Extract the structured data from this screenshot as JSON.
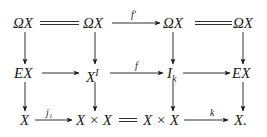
{
  "diagram": {
    "type": "commutative-diagram",
    "rows": [
      [
        "ΩX",
        "ΩX",
        "ΩX",
        "ΩX"
      ],
      [
        "EX",
        "X^I",
        "I_k",
        "EX"
      ],
      [
        "X",
        "X × X",
        "X × X",
        "X."
      ]
    ],
    "nodes": {
      "r0c0": "ΩX",
      "r0c1": "ΩX",
      "r0c2": "ΩX",
      "r0c3": "ΩX",
      "r1c0": "EX",
      "r1c1_base": "X",
      "r1c1_sup": "I",
      "r1c2_base": "I",
      "r1c2_sub": "k",
      "r1c3": "EX",
      "r2c0": "X",
      "r2c1": "X × X",
      "r2c2": "X × X",
      "r2c3": "X."
    },
    "edge_labels": {
      "top_middle": "f′",
      "mid_middle": "f",
      "bottom_left": "j₁",
      "bottom_right": "k"
    },
    "edges": [
      {
        "from": "r0c0",
        "to": "r0c1",
        "style": "equals"
      },
      {
        "from": "r0c1",
        "to": "r0c2",
        "style": "arrow",
        "label": "f′"
      },
      {
        "from": "r0c2",
        "to": "r0c3",
        "style": "equals"
      },
      {
        "from": "r1c0",
        "to": "r1c1",
        "style": "arrow"
      },
      {
        "from": "r1c1",
        "to": "r1c2",
        "style": "arrow",
        "label": "f"
      },
      {
        "from": "r1c2",
        "to": "r1c3",
        "style": "arrow"
      },
      {
        "from": "r2c0",
        "to": "r2c1",
        "style": "arrow",
        "label": "j₁"
      },
      {
        "from": "r2c1",
        "to": "r2c2",
        "style": "equals"
      },
      {
        "from": "r2c2",
        "to": "r2c3",
        "style": "arrow",
        "label": "k"
      },
      {
        "from": "r0c0",
        "to": "r1c0",
        "style": "arrow"
      },
      {
        "from": "r0c1",
        "to": "r1c1",
        "style": "arrow"
      },
      {
        "from": "r0c2",
        "to": "r1c2",
        "style": "arrow"
      },
      {
        "from": "r0c3",
        "to": "r1c3",
        "style": "arrow"
      },
      {
        "from": "r1c0",
        "to": "r2c0",
        "style": "arrow"
      },
      {
        "from": "r1c1",
        "to": "r2c1",
        "style": "arrow"
      },
      {
        "from": "r1c2",
        "to": "r2c2",
        "style": "arrow"
      },
      {
        "from": "r1c3",
        "to": "r2c3",
        "style": "arrow"
      }
    ]
  }
}
